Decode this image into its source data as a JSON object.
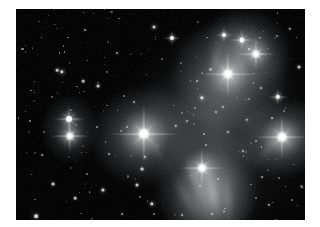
{
  "image": {
    "title": "Pleiades star cluster (M45)",
    "subject": "open star cluster with reflection nebulosity",
    "alt_text": "Grayscale astrophotograph of the Pleiades: bright blue-white stars with four-point diffraction spikes embedded in wispy reflection nebulosity against a black sky field",
    "border_color": "#ffffff",
    "sky_color": "#010101",
    "star_color": "#ffffff",
    "nebula_color": "#b9bfc6",
    "frame": {
      "left": 16,
      "top": 9,
      "width": 289,
      "height": 211
    }
  },
  "stars": [
    {
      "name": "alcyone",
      "x": 128,
      "y": 125,
      "r": 5.2,
      "halo": 46,
      "spike": 70,
      "b": 1.0
    },
    {
      "name": "atlas",
      "x": 212,
      "y": 65,
      "r": 4.6,
      "halo": 40,
      "spike": 56,
      "b": 0.98
    },
    {
      "name": "electra",
      "x": 266,
      "y": 128,
      "r": 4.4,
      "halo": 38,
      "spike": 54,
      "b": 0.96
    },
    {
      "name": "merope",
      "x": 186,
      "y": 159,
      "r": 4.0,
      "halo": 34,
      "spike": 46,
      "b": 0.93
    },
    {
      "name": "maia",
      "x": 240,
      "y": 45,
      "r": 3.6,
      "halo": 28,
      "spike": 40,
      "b": 0.9
    },
    {
      "name": "taygeta",
      "x": 54,
      "y": 127,
      "r": 3.6,
      "halo": 26,
      "spike": 40,
      "b": 0.9
    },
    {
      "name": "pleione",
      "x": 53,
      "y": 110,
      "r": 3.0,
      "halo": 20,
      "spike": 32,
      "b": 0.85
    },
    {
      "name": "asterope",
      "x": 226,
      "y": 31,
      "r": 2.6,
      "halo": 16,
      "spike": 26,
      "b": 0.8
    },
    {
      "name": "celaeno",
      "x": 208,
      "y": 26,
      "r": 2.0,
      "halo": 12,
      "spike": 20,
      "b": 0.72
    },
    {
      "name": "field-star-01",
      "x": 262,
      "y": 88,
      "r": 2.2,
      "halo": 13,
      "spike": 20,
      "b": 0.74
    },
    {
      "name": "field-star-02",
      "x": 156,
      "y": 29,
      "r": 2.0,
      "halo": 11,
      "spike": 18,
      "b": 0.7
    },
    {
      "name": "field-star-03",
      "x": 138,
      "y": 18,
      "r": 1.5,
      "halo": 8,
      "spike": 0,
      "b": 0.6
    },
    {
      "name": "field-star-04",
      "x": 186,
      "y": 89,
      "r": 1.7,
      "halo": 9,
      "spike": 0,
      "b": 0.64
    },
    {
      "name": "field-star-05",
      "x": 46,
      "y": 63,
      "r": 1.7,
      "halo": 9,
      "spike": 0,
      "b": 0.64
    },
    {
      "name": "field-star-06",
      "x": 41,
      "y": 61,
      "r": 1.3,
      "halo": 7,
      "spike": 0,
      "b": 0.56
    },
    {
      "name": "field-star-07",
      "x": 82,
      "y": 77,
      "r": 1.4,
      "halo": 7,
      "spike": 0,
      "b": 0.58
    },
    {
      "name": "field-star-08",
      "x": 67,
      "y": 72,
      "r": 1.3,
      "halo": 6,
      "spike": 0,
      "b": 0.54
    },
    {
      "name": "field-star-09",
      "x": 87,
      "y": 181,
      "r": 1.6,
      "halo": 8,
      "spike": 0,
      "b": 0.62
    },
    {
      "name": "field-star-10",
      "x": 37,
      "y": 175,
      "r": 1.4,
      "halo": 7,
      "spike": 0,
      "b": 0.58
    },
    {
      "name": "field-star-11",
      "x": 59,
      "y": 189,
      "r": 1.3,
      "halo": 6,
      "spike": 0,
      "b": 0.54
    },
    {
      "name": "field-star-12",
      "x": 20,
      "y": 207,
      "r": 1.8,
      "halo": 9,
      "spike": 0,
      "b": 0.66
    },
    {
      "name": "field-star-13",
      "x": 136,
      "y": 195,
      "r": 1.7,
      "halo": 8,
      "spike": 0,
      "b": 0.64
    },
    {
      "name": "field-star-14",
      "x": 121,
      "y": 176,
      "r": 1.5,
      "halo": 7,
      "spike": 0,
      "b": 0.6
    },
    {
      "name": "field-star-15",
      "x": 126,
      "y": 160,
      "r": 1.4,
      "halo": 7,
      "spike": 0,
      "b": 0.58
    },
    {
      "name": "field-star-16",
      "x": 129,
      "y": 148,
      "r": 1.2,
      "halo": 6,
      "spike": 0,
      "b": 0.52
    },
    {
      "name": "field-star-17",
      "x": 283,
      "y": 58,
      "r": 1.5,
      "halo": 7,
      "spike": 0,
      "b": 0.6
    },
    {
      "name": "field-star-18",
      "x": 274,
      "y": 20,
      "r": 1.2,
      "halo": 5,
      "spike": 0,
      "b": 0.5
    },
    {
      "name": "field-star-19",
      "x": 245,
      "y": 79,
      "r": 1.1,
      "halo": 5,
      "spike": 0,
      "b": 0.48
    },
    {
      "name": "field-star-20",
      "x": 231,
      "y": 111,
      "r": 1.2,
      "halo": 5,
      "spike": 0,
      "b": 0.5
    },
    {
      "name": "field-star-21",
      "x": 212,
      "y": 123,
      "r": 1.1,
      "halo": 5,
      "spike": 0,
      "b": 0.48
    },
    {
      "name": "field-star-22",
      "x": 200,
      "y": 103,
      "r": 1.0,
      "halo": 4,
      "spike": 0,
      "b": 0.45
    },
    {
      "name": "field-star-23",
      "x": 207,
      "y": 98,
      "r": 1.0,
      "halo": 4,
      "spike": 0,
      "b": 0.45
    },
    {
      "name": "field-star-24",
      "x": 227,
      "y": 142,
      "r": 1.1,
      "halo": 5,
      "spike": 0,
      "b": 0.48
    },
    {
      "name": "field-star-25",
      "x": 294,
      "y": 155,
      "r": 1.3,
      "halo": 6,
      "spike": 0,
      "b": 0.54
    },
    {
      "name": "field-star-26",
      "x": 286,
      "y": 178,
      "r": 1.1,
      "halo": 5,
      "spike": 0,
      "b": 0.48
    },
    {
      "name": "field-star-27",
      "x": 253,
      "y": 196,
      "r": 1.2,
      "halo": 5,
      "spike": 0,
      "b": 0.5
    },
    {
      "name": "field-star-28",
      "x": 196,
      "y": 205,
      "r": 1.0,
      "halo": 4,
      "spike": 0,
      "b": 0.45
    },
    {
      "name": "field-star-29",
      "x": 166,
      "y": 206,
      "r": 0.9,
      "halo": 4,
      "spike": 0,
      "b": 0.42
    },
    {
      "name": "field-star-30",
      "x": 106,
      "y": 205,
      "r": 0.9,
      "halo": 4,
      "spike": 0,
      "b": 0.42
    },
    {
      "name": "field-star-31",
      "x": 69,
      "y": 21,
      "r": 0.9,
      "halo": 4,
      "spike": 0,
      "b": 0.42
    },
    {
      "name": "field-star-32",
      "x": 101,
      "y": 44,
      "r": 0.9,
      "halo": 4,
      "spike": 0,
      "b": 0.42
    },
    {
      "name": "field-star-33",
      "x": 118,
      "y": 93,
      "r": 1.0,
      "halo": 4,
      "spike": 0,
      "b": 0.45
    },
    {
      "name": "field-star-34",
      "x": 160,
      "y": 117,
      "r": 1.2,
      "halo": 5,
      "spike": 0,
      "b": 0.5
    },
    {
      "name": "field-star-35",
      "x": 171,
      "y": 112,
      "r": 1.0,
      "halo": 4,
      "spike": 0,
      "b": 0.45
    },
    {
      "name": "field-star-36",
      "x": 26,
      "y": 146,
      "r": 0.9,
      "halo": 4,
      "spike": 0,
      "b": 0.42
    },
    {
      "name": "field-star-37",
      "x": 93,
      "y": 145,
      "r": 0.9,
      "halo": 4,
      "spike": 0,
      "b": 0.42
    },
    {
      "name": "field-star-38",
      "x": 246,
      "y": 168,
      "r": 0.9,
      "halo": 4,
      "spike": 0,
      "b": 0.42
    },
    {
      "name": "field-star-39",
      "x": 181,
      "y": 72,
      "r": 0.9,
      "halo": 4,
      "spike": 0,
      "b": 0.42
    },
    {
      "name": "field-star-40",
      "x": 256,
      "y": 109,
      "r": 0.9,
      "halo": 4,
      "spike": 0,
      "b": 0.42
    }
  ],
  "nebulae": [
    {
      "name": "alcyone-nebula",
      "x": 128,
      "y": 126,
      "w": 104,
      "h": 92,
      "i": 0.52,
      "rot": -15
    },
    {
      "name": "atlas-nebula",
      "x": 213,
      "y": 68,
      "w": 112,
      "h": 108,
      "i": 0.56,
      "rot": 10
    },
    {
      "name": "maia-nebula",
      "x": 232,
      "y": 38,
      "w": 86,
      "h": 72,
      "i": 0.44,
      "rot": 25
    },
    {
      "name": "electra-nebula",
      "x": 266,
      "y": 129,
      "w": 92,
      "h": 74,
      "i": 0.5,
      "rot": -8
    },
    {
      "name": "merope-nebula",
      "x": 192,
      "y": 176,
      "w": 100,
      "h": 118,
      "i": 0.5,
      "rot": 8
    },
    {
      "name": "merope-streaks",
      "x": 196,
      "y": 190,
      "w": 78,
      "h": 96,
      "i": 0.4,
      "rot": -6
    },
    {
      "name": "taygeta-nebula",
      "x": 54,
      "y": 120,
      "w": 54,
      "h": 66,
      "i": 0.34,
      "rot": 0
    },
    {
      "name": "bridge-nebula",
      "x": 188,
      "y": 110,
      "w": 120,
      "h": 90,
      "i": 0.2,
      "rot": 30
    },
    {
      "name": "outer-glow",
      "x": 206,
      "y": 120,
      "w": 190,
      "h": 200,
      "i": 0.14,
      "rot": 0
    }
  ]
}
